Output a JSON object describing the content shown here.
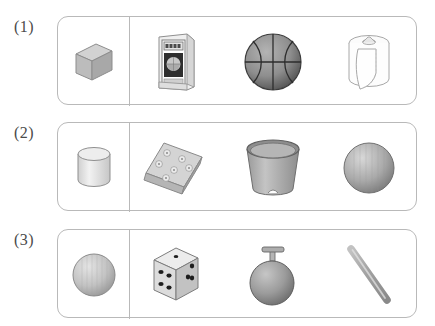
{
  "page": {
    "background_color": "#ffffff",
    "border_color": "#b9b9b9"
  },
  "rows": [
    {
      "label": "(1)",
      "reference": {
        "name": "cube",
        "icon": "cube-icon"
      },
      "objects": [
        {
          "name": "book",
          "icon": "book-icon",
          "cover_text": ""
        },
        {
          "name": "basketball",
          "icon": "basketball-icon"
        },
        {
          "name": "toilet-paper-roll",
          "icon": "paper-roll-icon"
        }
      ]
    },
    {
      "label": "(2)",
      "reference": {
        "name": "cylinder",
        "icon": "cylinder-icon"
      },
      "objects": [
        {
          "name": "soap-bar",
          "icon": "soap-bar-icon"
        },
        {
          "name": "bucket",
          "icon": "bucket-icon"
        },
        {
          "name": "ball",
          "icon": "sphere-icon"
        }
      ]
    },
    {
      "label": "(3)",
      "reference": {
        "name": "sphere",
        "icon": "sphere-icon"
      },
      "objects": [
        {
          "name": "dice",
          "icon": "dice-icon",
          "top_face_pips": 5,
          "right_face_pips": 3
        },
        {
          "name": "balloon",
          "icon": "balloon-icon"
        },
        {
          "name": "stick",
          "icon": "rod-icon"
        }
      ]
    }
  ]
}
